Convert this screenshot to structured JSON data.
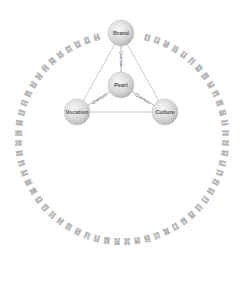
{
  "diagram": {
    "nodes": [
      {
        "id": "brand",
        "label": "Brand"
      },
      {
        "id": "pearl",
        "label": "Pearl"
      },
      {
        "id": "vocation",
        "label": "Vocation"
      },
      {
        "id": "culture",
        "label": "Culture"
      }
    ],
    "edges": [
      {
        "from": "brand",
        "to": "pearl",
        "label": "Quantum"
      },
      {
        "from": "vocation",
        "to": "pearl",
        "label": "Quantum"
      },
      {
        "from": "pearl",
        "to": "culture",
        "label": "Quantum"
      },
      {
        "from": "brand",
        "to": "vocation",
        "label": ""
      },
      {
        "from": "brand",
        "to": "culture",
        "label": ""
      },
      {
        "from": "vocation",
        "to": "culture",
        "label": ""
      }
    ],
    "ring": {
      "symbol_set": "i-ching-hexagrams",
      "count": 64
    },
    "colors": {
      "node_fill_light": "#f4f4f4",
      "node_fill_dark": "#bdbdbd",
      "edge": "#aaaaaa",
      "ring_glyph": "#9a9a9a",
      "label": "#555555"
    }
  }
}
